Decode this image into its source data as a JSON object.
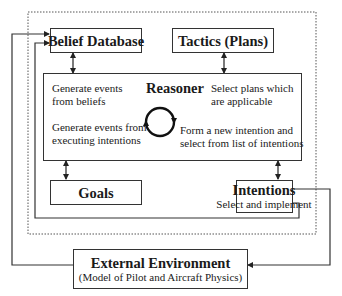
{
  "diagram": {
    "boxes": {
      "belief_database": {
        "title": "Belief Database"
      },
      "tactics": {
        "title": "Tactics (Plans)"
      },
      "reasoner": {
        "title": "Reasoner",
        "texts": {
          "generate_from_beliefs": [
            "Generate events",
            "from beliefs"
          ],
          "generate_from_intentions": [
            "Generate events from",
            "executing intentions"
          ],
          "select_plans": [
            "Select plans which",
            "are applicable"
          ],
          "form_intention": [
            "Form a new intention and",
            "select from list of intentions"
          ]
        }
      },
      "goals": {
        "title": "Goals"
      },
      "intentions": {
        "title": "Intentions",
        "subtitle": "Select and implement"
      },
      "external_environment": {
        "title": "External Environment",
        "subtitle": "(Model of Pilot and Aircraft Physics)"
      }
    },
    "colors": {
      "line": "#333333",
      "dotted_boundary": "#555555",
      "background": "#ffffff"
    }
  }
}
